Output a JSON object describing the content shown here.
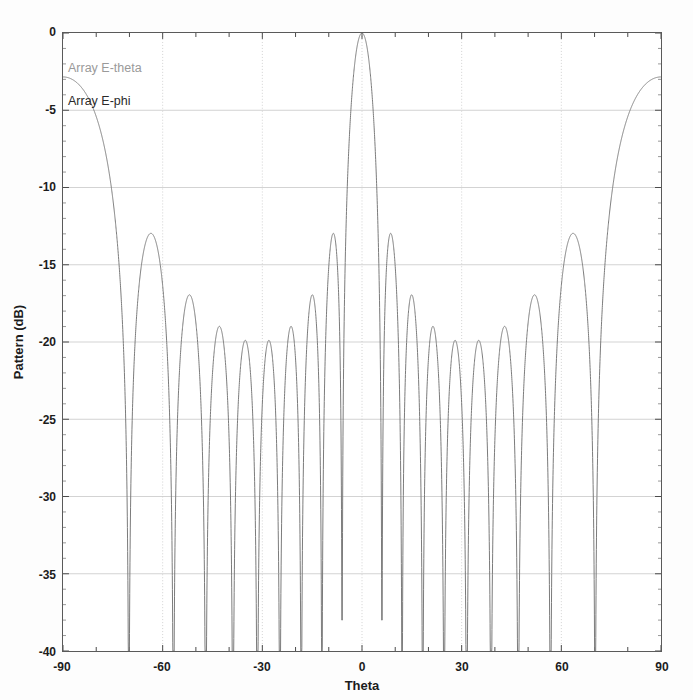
{
  "chart_data": {
    "type": "line",
    "title": "",
    "subtitle": "",
    "xlabel": "Theta",
    "ylabel": "Pattern (dB)",
    "xlim": [
      -90,
      90
    ],
    "ylim": [
      -40,
      0
    ],
    "xticks": [
      -90,
      -60,
      -30,
      0,
      30,
      60,
      90
    ],
    "xtick_labels": [
      "-90",
      "-60",
      "-30",
      "0",
      "30",
      "60",
      "90"
    ],
    "xtick_minor_step": 10,
    "yticks": [
      0,
      -5,
      -10,
      -15,
      -20,
      -25,
      -30,
      -35,
      -40
    ],
    "ytick_labels": [
      "0",
      "-5",
      "-10",
      "-15",
      "-20",
      "-25",
      "-30",
      "-35",
      "-40"
    ],
    "grid": true,
    "grid_color": "#c8c8c8",
    "legend_position": "upper-left",
    "legend": [
      {
        "name": "Array E-theta",
        "color": "#9a9a9a"
      },
      {
        "name": "Array E-phi",
        "color": "#2a2a2a"
      }
    ],
    "series": [
      {
        "name": "Array E-phi",
        "color": "#7a7a7a",
        "line_width": 1,
        "description": "Uniform linear array radiation pattern: main beam at 0 deg peaking at 0 dB, symmetric sidelobes tapering from -25.3 dB nearest the beam to -30 dB at the array edges, deep nulls to below -40 dB.",
        "main_lobe": {
          "theta": 0,
          "level_db": 0,
          "null_to_null_deg": 12
        },
        "sidelobe_peaks": [
          {
            "theta": -71.0,
            "level_db": -30.0
          },
          {
            "theta": -57.0,
            "level_db": -29.8
          },
          {
            "theta": -46.0,
            "level_db": -29.4
          },
          {
            "theta": -36.5,
            "level_db": -28.6
          },
          {
            "theta": -28.0,
            "level_db": -27.2
          },
          {
            "theta": -20.0,
            "level_db": -26.1
          },
          {
            "theta": -13.5,
            "level_db": -25.4
          },
          {
            "theta": -8.8,
            "level_db": -25.2
          },
          {
            "theta": 8.8,
            "level_db": -25.2
          },
          {
            "theta": 13.5,
            "level_db": -25.4
          },
          {
            "theta": 20.0,
            "level_db": -26.1
          },
          {
            "theta": 28.0,
            "level_db": -27.2
          },
          {
            "theta": 36.5,
            "level_db": -28.6
          },
          {
            "theta": 46.0,
            "level_db": -29.4
          },
          {
            "theta": 57.0,
            "level_db": -29.8
          },
          {
            "theta": 71.0,
            "level_db": -30.0
          }
        ],
        "nulls": [
          -83.0,
          -64.5,
          -51.5,
          -41.0,
          -32.0,
          -24.0,
          -16.5,
          -11.0,
          -6.0,
          6.0,
          11.0,
          16.5,
          24.0,
          32.0,
          41.0,
          51.5,
          64.5,
          83.0
        ],
        "null_floor_db": -40,
        "shallow_null_db": -38
      }
    ]
  }
}
